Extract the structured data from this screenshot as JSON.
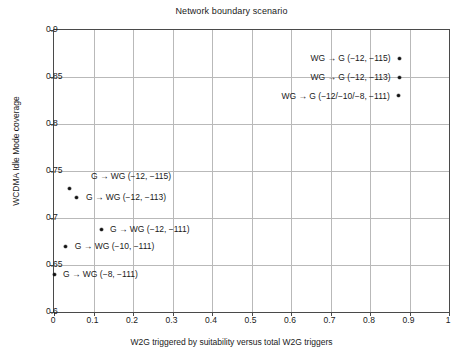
{
  "chart_data": {
    "type": "scatter",
    "title": "Network boundary scenario",
    "xlabel": "W2G triggered by suitability versus total W2G triggers",
    "ylabel": "WCDMA Idle Mode coverage",
    "xlim": [
      0,
      1
    ],
    "ylim": [
      0.6,
      0.9
    ],
    "grid": true,
    "legend": "none",
    "xticks": [
      "0",
      "0.1",
      "0.2",
      "0.3",
      "0.4",
      "0.5",
      "0.6",
      "0.7",
      "0.8",
      "0.9",
      "1"
    ],
    "xtick_values": [
      0,
      0.1,
      0.2,
      0.3,
      0.4,
      0.5,
      0.6,
      0.7,
      0.8,
      0.9,
      1
    ],
    "yticks": [
      "0.6",
      "0.65",
      "0.7",
      "0.75",
      "0.8",
      "0.85",
      "0.9"
    ],
    "ytick_values": [
      0.6,
      0.65,
      0.7,
      0.75,
      0.8,
      0.85,
      0.9
    ],
    "marker_color": "#111111",
    "grid_color": "#b9b9b9",
    "axis_color": "#4a4a4a",
    "points": [
      {
        "x": 0.875,
        "y": 0.87,
        "label": "WG → G (−12, −115)",
        "label_side": "left"
      },
      {
        "x": 0.875,
        "y": 0.85,
        "label": "WG → G (−12, −113)",
        "label_side": "left"
      },
      {
        "x": 0.873,
        "y": 0.83,
        "label": "WG → G (−12/−10/−8, −111)",
        "label_side": "left"
      },
      {
        "x": 0.038,
        "y": 0.731,
        "label": "G → WG (−12, −115)",
        "label_side": "above"
      },
      {
        "x": 0.058,
        "y": 0.722,
        "label": "G → WG (−12, −113)",
        "label_side": "right"
      },
      {
        "x": 0.119,
        "y": 0.688,
        "label": "G → WG (−12, −111)",
        "label_side": "right"
      },
      {
        "x": 0.03,
        "y": 0.67,
        "label": "G → WG (−10, −111)",
        "label_side": "right"
      },
      {
        "x": 0.0,
        "y": 0.64,
        "label": "G → WG (−8, −111)",
        "label_side": "right"
      }
    ]
  }
}
